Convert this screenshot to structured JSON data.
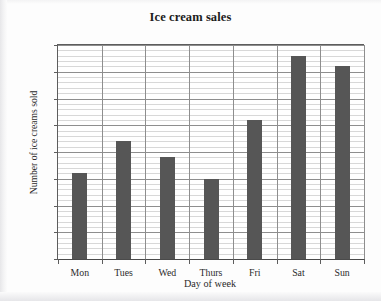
{
  "chart_data": {
    "type": "bar",
    "title": "Ice cream sales",
    "xlabel": "Day of week",
    "ylabel": "Number of ice creams sold",
    "categories": [
      "Mon",
      "Tues",
      "Wed",
      "Thurs",
      "Fri",
      "Sat",
      "Sun"
    ],
    "values": [
      16,
      22,
      19,
      15,
      26,
      38,
      36
    ],
    "ylim": [
      0,
      40
    ],
    "ytick_labels": [
      "0",
      "5",
      "10",
      "15",
      "20",
      "25",
      "30",
      "35",
      "40"
    ],
    "ytick_values": [
      0,
      5,
      10,
      15,
      20,
      25,
      30,
      35,
      40
    ],
    "y_major_step": 5,
    "y_minor_step": 1,
    "grid": "major and minor horizontal gridlines, vertical category separators",
    "legend": null,
    "bar_color": "#565656",
    "grid_major_color": "#8e8e8e",
    "grid_minor_color": "#d8d8d8",
    "axis_color": "#4a4a4a",
    "background_color": "#ffffff"
  }
}
